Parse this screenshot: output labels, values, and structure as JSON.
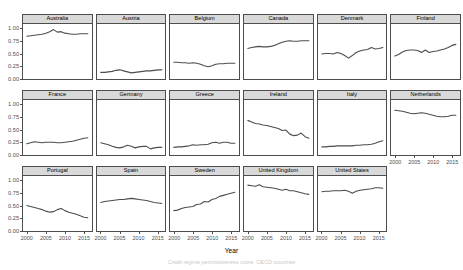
{
  "chart_data": {
    "type": "line",
    "title": "",
    "xlabel": "Year",
    "ylabel": "Credit regime permissiveness score",
    "caption": "Credit regime permissiveness score, OECD countries",
    "facet_layout": {
      "rows": 3,
      "cols": 6,
      "panels_in_last_row": 5
    },
    "xlim": [
      1999,
      2017
    ],
    "ylim": [
      0,
      1.08
    ],
    "xticks": [
      2000,
      2005,
      2010,
      2015
    ],
    "xticklabels": [
      "2000",
      "2005",
      "2010",
      "2015"
    ],
    "yticks": [
      0.0,
      0.25,
      0.5,
      0.75,
      1.0
    ],
    "yticklabels": [
      "0.00",
      "0.25",
      "0.50",
      "0.75",
      "1.00"
    ],
    "grid": false,
    "legend": "none",
    "line_color": "#4d4d4d",
    "strip_color": "#d9d9d9",
    "x": [
      2000,
      2001,
      2002,
      2003,
      2004,
      2005,
      2006,
      2007,
      2008,
      2009,
      2010,
      2011,
      2012,
      2013,
      2014,
      2015,
      2016
    ],
    "series": [
      {
        "name": "Australia",
        "values": [
          0.84,
          0.85,
          0.86,
          0.87,
          0.88,
          0.9,
          0.93,
          0.97,
          0.92,
          0.93,
          0.9,
          0.89,
          0.88,
          0.88,
          0.89,
          0.89,
          0.89
        ]
      },
      {
        "name": "Austria",
        "values": [
          0.13,
          0.13,
          0.14,
          0.15,
          0.17,
          0.18,
          0.16,
          0.14,
          0.12,
          0.13,
          0.14,
          0.15,
          0.16,
          0.16,
          0.17,
          0.18,
          0.18
        ]
      },
      {
        "name": "Belgium",
        "values": [
          0.33,
          0.33,
          0.32,
          0.32,
          0.31,
          0.32,
          0.31,
          0.29,
          0.26,
          0.24,
          0.26,
          0.29,
          0.3,
          0.3,
          0.31,
          0.31,
          0.31
        ]
      },
      {
        "name": "Canada",
        "values": [
          0.6,
          0.62,
          0.63,
          0.64,
          0.63,
          0.63,
          0.64,
          0.66,
          0.69,
          0.72,
          0.74,
          0.75,
          0.74,
          0.74,
          0.75,
          0.75,
          0.75
        ]
      },
      {
        "name": "Denmark",
        "values": [
          0.49,
          0.5,
          0.5,
          0.49,
          0.52,
          0.5,
          0.46,
          0.41,
          0.46,
          0.52,
          0.55,
          0.57,
          0.58,
          0.62,
          0.59,
          0.6,
          0.62
        ]
      },
      {
        "name": "Finland",
        "values": [
          0.45,
          0.48,
          0.53,
          0.56,
          0.57,
          0.57,
          0.56,
          0.52,
          0.57,
          0.52,
          0.54,
          0.55,
          0.57,
          0.59,
          0.62,
          0.66,
          0.68
        ]
      },
      {
        "name": "France",
        "values": [
          0.22,
          0.24,
          0.26,
          0.25,
          0.24,
          0.25,
          0.25,
          0.25,
          0.24,
          0.24,
          0.25,
          0.26,
          0.27,
          0.29,
          0.31,
          0.33,
          0.34
        ]
      },
      {
        "name": "Germany",
        "values": [
          0.24,
          0.22,
          0.2,
          0.17,
          0.15,
          0.14,
          0.16,
          0.19,
          0.17,
          0.14,
          0.16,
          0.17,
          0.17,
          0.12,
          0.14,
          0.15,
          0.15
        ]
      },
      {
        "name": "Greece",
        "values": [
          0.15,
          0.16,
          0.16,
          0.17,
          0.18,
          0.2,
          0.19,
          0.2,
          0.2,
          0.21,
          0.24,
          0.25,
          0.23,
          0.25,
          0.25,
          0.23,
          0.23
        ]
      },
      {
        "name": "Ireland",
        "values": [
          0.68,
          0.65,
          0.62,
          0.61,
          0.59,
          0.58,
          0.56,
          0.54,
          0.52,
          0.48,
          0.49,
          0.41,
          0.38,
          0.39,
          0.43,
          0.36,
          0.33
        ]
      },
      {
        "name": "Italy",
        "values": [
          0.16,
          0.16,
          0.17,
          0.17,
          0.18,
          0.18,
          0.18,
          0.18,
          0.18,
          0.19,
          0.19,
          0.2,
          0.2,
          0.21,
          0.23,
          0.26,
          0.28
        ]
      },
      {
        "name": "Netherlands",
        "values": [
          0.88,
          0.87,
          0.86,
          0.84,
          0.82,
          0.81,
          0.82,
          0.83,
          0.82,
          0.8,
          0.78,
          0.76,
          0.75,
          0.75,
          0.76,
          0.78,
          0.78
        ]
      },
      {
        "name": "Portugal",
        "values": [
          0.5,
          0.48,
          0.46,
          0.44,
          0.42,
          0.39,
          0.37,
          0.38,
          0.42,
          0.44,
          0.4,
          0.37,
          0.35,
          0.33,
          0.3,
          0.27,
          0.26
        ]
      },
      {
        "name": "Spain",
        "values": [
          0.56,
          0.58,
          0.59,
          0.6,
          0.61,
          0.62,
          0.62,
          0.63,
          0.64,
          0.63,
          0.62,
          0.61,
          0.6,
          0.58,
          0.56,
          0.55,
          0.54
        ]
      },
      {
        "name": "Sweden",
        "values": [
          0.4,
          0.41,
          0.44,
          0.46,
          0.47,
          0.48,
          0.52,
          0.53,
          0.58,
          0.57,
          0.62,
          0.64,
          0.68,
          0.7,
          0.72,
          0.74,
          0.76
        ]
      },
      {
        "name": "United Kingdom",
        "values": [
          0.9,
          0.89,
          0.88,
          0.91,
          0.87,
          0.86,
          0.85,
          0.84,
          0.82,
          0.8,
          0.82,
          0.79,
          0.79,
          0.77,
          0.75,
          0.73,
          0.72
        ]
      },
      {
        "name": "United States",
        "values": [
          0.77,
          0.78,
          0.78,
          0.79,
          0.79,
          0.79,
          0.8,
          0.78,
          0.74,
          0.78,
          0.8,
          0.81,
          0.82,
          0.83,
          0.85,
          0.85,
          0.84
        ]
      }
    ]
  },
  "axis": {
    "ylabel": "Credit regime permissiveness score",
    "xlabel": "Year",
    "yticklabels": [
      "1.00",
      "0.75",
      "0.50",
      "0.25",
      "0.00"
    ],
    "xticklabels": [
      "2000",
      "2005",
      "2010",
      "2015"
    ]
  },
  "panels": [
    {
      "label": "Australia"
    },
    {
      "label": "Austria"
    },
    {
      "label": "Belgium"
    },
    {
      "label": "Canada"
    },
    {
      "label": "Denmark"
    },
    {
      "label": "Finland"
    },
    {
      "label": "France"
    },
    {
      "label": "Germany"
    },
    {
      "label": "Greece"
    },
    {
      "label": "Ireland"
    },
    {
      "label": "Italy"
    },
    {
      "label": "Netherlands"
    },
    {
      "label": "Portugal"
    },
    {
      "label": "Spain"
    },
    {
      "label": "Sweden"
    },
    {
      "label": "United Kingdom"
    },
    {
      "label": "United States"
    }
  ],
  "caption": "Credit regime permissiveness score, OECD countries"
}
